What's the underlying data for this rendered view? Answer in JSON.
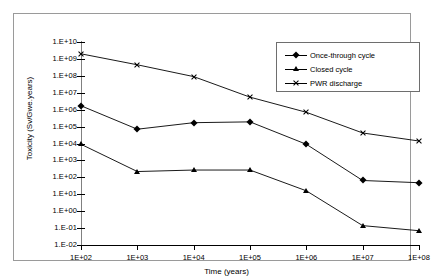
{
  "chart_data": {
    "type": "line",
    "title": "",
    "xlabel": "Time (years)",
    "ylabel": "Toxicity (Sv/Gwe.years)",
    "x_scale": "log",
    "y_scale": "log",
    "x": [
      100,
      1000,
      10000,
      100000,
      1000000,
      10000000,
      100000000
    ],
    "x_tick_labels": [
      "1E+02",
      "1E+03",
      "1E+04",
      "1E+05",
      "1E+06",
      "1E+07",
      "1E+08"
    ],
    "y_tick_labels": [
      "1.E+10",
      "1.E+09",
      "1.E+08",
      "1.E+07",
      "1.E+06",
      "1.E+05",
      "1.E+04",
      "1.E+03",
      "1.E+02",
      "1.E+01",
      "1.E+00",
      "1.E-01",
      "1.E-02"
    ],
    "ylim": [
      0.01,
      10000000000
    ],
    "xlim": [
      100,
      100000000
    ],
    "grid": false,
    "legend_position": "top-right",
    "series": [
      {
        "name": "Once-through cycle",
        "marker": "diamond",
        "values": [
          1700000.0,
          70000.0,
          170000.0,
          190000.0,
          9000.0,
          65.0,
          48.0
        ]
      },
      {
        "name": "Closed cycle",
        "marker": "triangle",
        "values": [
          9000.0,
          220.0,
          270.0,
          270.0,
          16.0,
          0.14,
          0.07
        ]
      },
      {
        "name": "PWR discharge",
        "marker": "cross",
        "values": [
          2000000000.0,
          450000000.0,
          90000000.0,
          5500000.0,
          700000.0,
          42000.0,
          14000.0
        ]
      }
    ]
  },
  "legend": {
    "items": [
      {
        "label": "Once-through cycle",
        "marker": "diamond"
      },
      {
        "label": "Closed cycle",
        "marker": "triangle"
      },
      {
        "label": "PWR discharge",
        "marker": "cross"
      }
    ]
  }
}
